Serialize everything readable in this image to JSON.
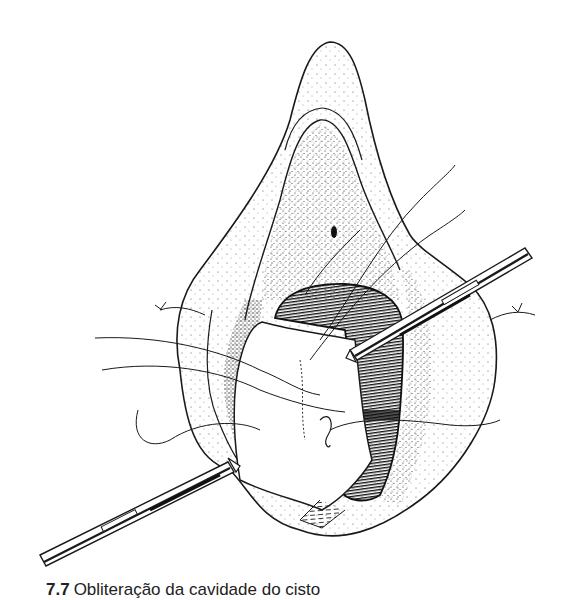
{
  "figure": {
    "elements": [
      "needle-holder-upper-right",
      "needle-holder-lower-left",
      "sutures",
      "cyst-cavity",
      "tissue-flap",
      "knot-left",
      "knot-right"
    ],
    "ink_color": "#1a1a1a",
    "background_color": "#ffffff"
  },
  "caption": {
    "number": "7.7",
    "text": "Obliteração da cavidade do cisto"
  }
}
